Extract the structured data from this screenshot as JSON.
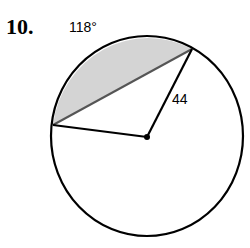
{
  "problem": {
    "number": "10.",
    "arc_angle_label": "118°",
    "radius_label": "44"
  },
  "colors": {
    "stroke": "#000000",
    "segment_fill": "#d4d4d4",
    "chord": "#555555"
  }
}
